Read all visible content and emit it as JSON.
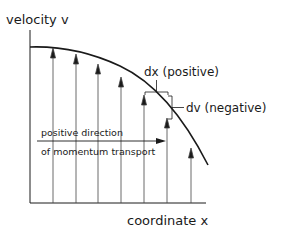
{
  "diagram": {
    "y_axis_label": "velocity v",
    "x_axis_label": "coordinate x",
    "dx_label": "dx (positive)",
    "dv_label": "dv (negative)",
    "momentum_label_line1": "positive direction",
    "momentum_label_line2": "of momentum transport",
    "stroke_color": "#1a1a1a",
    "velocity_arrows_count": 7
  }
}
